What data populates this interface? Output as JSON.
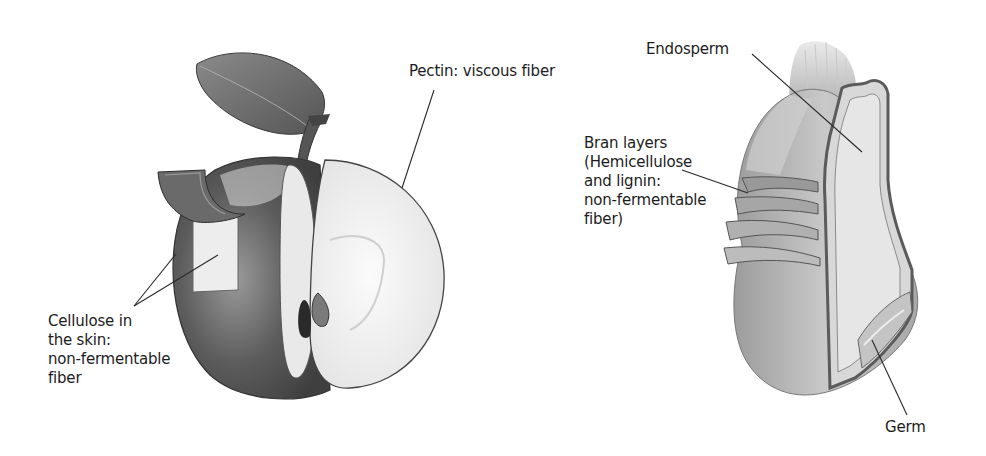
{
  "figure": {
    "panels": [
      {
        "id": "apple",
        "subject": "Apple cross-section",
        "labels": [
          {
            "key": "pectin",
            "lines": [
              "Pectin: viscous fiber"
            ]
          },
          {
            "key": "cellulose",
            "lines": [
              "Cellulose in",
              "the skin:",
              "non-fermentable",
              "fiber"
            ]
          }
        ]
      },
      {
        "id": "grain",
        "subject": "Wheat kernel cross-section",
        "labels": [
          {
            "key": "endosperm",
            "lines": [
              "Endosperm"
            ]
          },
          {
            "key": "bran",
            "lines": [
              "Bran layers",
              "(Hemicellulose",
              "and lignin:",
              "non-fermentable",
              "fiber)"
            ]
          },
          {
            "key": "germ",
            "lines": [
              "Germ"
            ]
          }
        ]
      }
    ]
  },
  "colors": {
    "background": "#ffffff",
    "text": "#1c1c1c",
    "leader_line": "#2a2a2a",
    "apple_skin_dark": "#5a5a5a",
    "apple_flesh": "#f2f2f2",
    "grain_body": "#b8b8b8",
    "grain_layer": "#6e6e6e"
  }
}
